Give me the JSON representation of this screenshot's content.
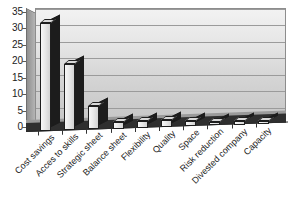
{
  "chart_data": {
    "type": "bar",
    "title": "",
    "subtitle": "",
    "xlabel": "",
    "ylabel": "",
    "ylim": [
      0,
      35
    ],
    "yticks": [
      0,
      5,
      10,
      15,
      20,
      25,
      30,
      35
    ],
    "ytick_labels": [
      "0",
      "5",
      "10",
      "15",
      "20",
      "25",
      "30",
      "35"
    ],
    "grid": true,
    "legend": false,
    "legend_position": "none",
    "style": "3d-grayscale-bar",
    "categories": [
      "Cost savings",
      "Acces to skills",
      "Strategic sheet",
      "Balance sheet",
      "Flexibility",
      "Quality",
      "Space",
      "Risk reduction",
      "Divested company",
      "Capacity"
    ],
    "values": [
      33,
      20,
      7,
      2,
      2,
      2,
      1.5,
      1,
      1,
      1
    ],
    "colors": {
      "bar_face": "#e9e9e9",
      "bar_side": "#1c1c1c",
      "bar_top": "#d8d8d8",
      "plot_background": "#d3d3d3",
      "gridline": "#9b9b9b",
      "axis": "#2b2b2b",
      "text": "#1c1c1c",
      "page_background": "#ffffff"
    }
  }
}
